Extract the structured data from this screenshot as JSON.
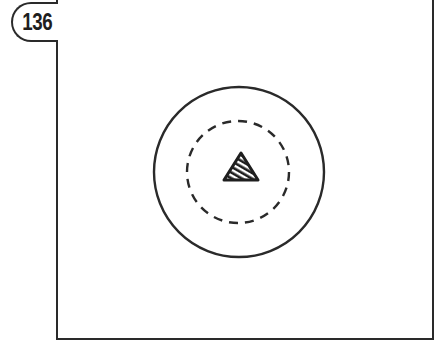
{
  "figure": {
    "number_badge": "136",
    "frame": {
      "color": "#2a2a2a"
    },
    "outer_circle": {
      "cx": 239,
      "cy": 172,
      "r": 85,
      "style": "solid",
      "color": "#2a2a2a"
    },
    "inner_circle": {
      "cx": 238,
      "cy": 172,
      "r": 51,
      "style": "dashed",
      "color": "#2a2a2a"
    },
    "center_marker": {
      "shape": "triangle",
      "fill": "hatched",
      "color": "#1e1e1e"
    }
  }
}
